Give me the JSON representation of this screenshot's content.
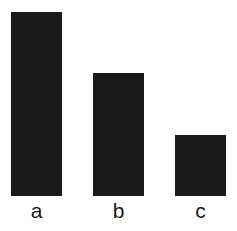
{
  "chart_data": {
    "type": "bar",
    "title": "",
    "xlabel": "",
    "ylabel": "",
    "categories": [
      "a",
      "b",
      "c"
    ],
    "values": [
      3,
      2,
      1
    ],
    "ylim": [
      0,
      3
    ],
    "grid": false,
    "legend": null,
    "bar_color": "#1a1a1a"
  }
}
